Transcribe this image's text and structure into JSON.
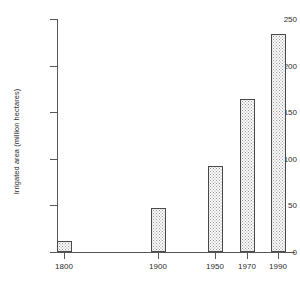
{
  "chart_data": {
    "type": "bar",
    "title": "",
    "xlabel": "",
    "ylabel": "Irrigated area (million hectares)",
    "categories": [
      "1800",
      "1900",
      "1950",
      "1970",
      "1990"
    ],
    "values": [
      12,
      47,
      92,
      164,
      234
    ],
    "ylim": [
      0,
      250
    ],
    "yticks": [
      0,
      50,
      100,
      150,
      200,
      250
    ],
    "ytick_labels": [
      "0",
      "50",
      "100",
      "150",
      "200",
      "250"
    ],
    "xtick_labels": [
      "1800",
      "1900",
      "1950",
      "1970",
      "1990"
    ],
    "grid": false,
    "legend": false,
    "bar_fill": "#fbfbfb",
    "bar_edge": "#4a4a4a",
    "axis_color": "#575757",
    "text_color": "#2b2b2b"
  }
}
